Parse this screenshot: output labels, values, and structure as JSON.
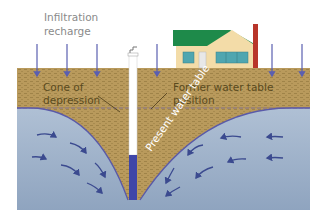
{
  "labels": {
    "infiltration_line1": "Infiltration",
    "infiltration_line2": "recharge",
    "cone_line1": "Cone of",
    "cone_line2": "depression",
    "former_line1": "Former water table",
    "former_line2": "position",
    "present": "Present water table"
  },
  "colors": {
    "soil": "#b99a5c",
    "soil_dots": "#9c7f45",
    "water_top": "#b8c8dc",
    "water_bottom": "#8ea3be",
    "water_line": "#5a5aa8",
    "arrow": "#3b4a8f",
    "recharge_arrow": "#5a5fb0",
    "well_water": "#3f46a8",
    "house_wall": "#f3dca8",
    "house_roof": "#1e8a4a",
    "house_window": "#4fa6b0",
    "chimney": "#b8352a",
    "text_label": "#5a4a1e",
    "text_sky": "#8a8a8a",
    "text_water": "#ffffff"
  }
}
